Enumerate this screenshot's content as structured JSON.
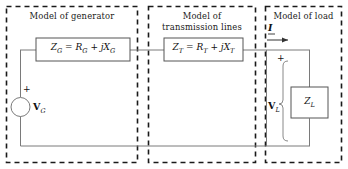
{
  "diagram": {
    "type": "circuit-schematic",
    "canvas": {
      "width": 348,
      "height": 169
    },
    "colors": {
      "background": "#ffffff",
      "wire": "#7a7a7a",
      "component_outline": "#555555",
      "panel_border": "#1a1a1a",
      "text": "#111111"
    },
    "panels": [
      {
        "id": "generator",
        "title": "Model of generator",
        "title_lines": "Model of generator"
      },
      {
        "id": "transmission",
        "title": "Model of transmission lines",
        "title_lines": "Model of\ntransmission lines"
      },
      {
        "id": "load",
        "title": "Model of load",
        "title_lines": "Model of load"
      }
    ],
    "components": {
      "generator_impedance": {
        "name": "Z_G = R_G + jX_G",
        "symbol": "Z",
        "sub": "G",
        "eq": " = R",
        "sub2": "G",
        "plus": " + j",
        "x_sym": "X",
        "sub3": "G"
      },
      "transmission_impedance": {
        "name": "Z_T = R_T + jX_T",
        "symbol": "Z",
        "sub": "T",
        "eq": " = R",
        "sub2": "T",
        "plus": " + j",
        "x_sym": "X",
        "sub3": "T"
      },
      "load_impedance": {
        "name": "Z_L",
        "symbol": "Z",
        "sub": "L"
      },
      "voltage_source": {
        "name": "V_G",
        "symbol": "V",
        "sub": "G",
        "polarity": "+"
      },
      "load_voltage": {
        "name": "V_L",
        "symbol": "V",
        "sub": "L",
        "polarity": "+"
      },
      "current": {
        "name": "I",
        "symbol": "I",
        "direction": "right"
      }
    }
  }
}
